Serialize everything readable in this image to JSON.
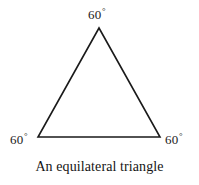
{
  "figure": {
    "caption": "An equilateral triangle",
    "background_color": "#ffffff",
    "stroke_color": "#1a1a1a",
    "text_color": "#1a1a1a",
    "stroke_width": 1.6,
    "angle_unit_symbol": "°",
    "labels": {
      "apex": {
        "value": "60",
        "unit": "°",
        "full_text": "60°"
      },
      "bottom_left": {
        "value": "60",
        "unit": "°",
        "full_text": "60°"
      },
      "bottom_right": {
        "value": "60",
        "unit": "°",
        "full_text": "60°"
      }
    },
    "vertices": {
      "apex": {
        "x": 99,
        "y": 28
      },
      "bottom_left": {
        "x": 38,
        "y": 137
      },
      "bottom_right": {
        "x": 160,
        "y": 137
      }
    },
    "polygon_points": "99,28 160,137 38,137"
  }
}
